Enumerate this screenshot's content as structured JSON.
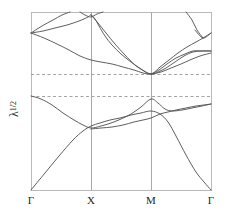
{
  "figure": {
    "background_color": "#ffffff",
    "frame_color": "#b9b9b9",
    "curve_color": "#555555",
    "gridline_color": "#a8a8a8",
    "dashed_line_color": "#9a9a9a"
  },
  "axes": {
    "y_label_base": "λ",
    "y_label_exponent": "1/2",
    "x_ticks": [
      {
        "label": "Γ",
        "x_px": 31
      },
      {
        "label": "X",
        "x_px": 91
      },
      {
        "label": "M",
        "x_px": 151
      },
      {
        "label": "Γ",
        "x_px": 211
      }
    ],
    "frame": {
      "left": 31,
      "right": 211,
      "top": 12,
      "bottom": 190
    },
    "vertical_gridlines_px": [
      91,
      151
    ],
    "horizontal_dashed_lines_px": [
      74,
      96
    ]
  },
  "chart_data": {
    "type": "line",
    "title": "",
    "xlabel": "",
    "ylabel": "λ^1/2",
    "x": [
      0,
      1,
      2,
      3
    ],
    "categories": [
      "Γ",
      "X",
      "M",
      "Γ"
    ],
    "xlim": [
      0,
      3
    ],
    "ylim": [
      0,
      1
    ],
    "grid": true,
    "legend": "none",
    "annotations": [
      {
        "type": "hline",
        "label": "upper dashed reference",
        "y_px": 74
      },
      {
        "type": "hline",
        "label": "lower dashed reference",
        "y_px": 96
      }
    ],
    "series": [
      {
        "name": "acoustic-band-1",
        "points_px": [
          [
            31,
            190
          ],
          [
            45,
            173
          ],
          [
            59,
            156
          ],
          [
            73,
            140
          ],
          [
            83,
            131
          ],
          [
            91,
            126
          ],
          [
            100,
            123
          ],
          [
            110,
            120
          ],
          [
            120,
            118
          ],
          [
            131,
            115
          ],
          [
            141,
            113
          ],
          [
            151,
            111
          ],
          [
            160,
            114
          ],
          [
            168,
            122
          ],
          [
            176,
            136
          ],
          [
            186,
            155
          ],
          [
            196,
            172
          ],
          [
            204,
            182
          ],
          [
            211,
            190
          ]
        ]
      },
      {
        "name": "acoustic-band-2",
        "points_px": [
          [
            31,
            96
          ],
          [
            41,
            99
          ],
          [
            52,
            105
          ],
          [
            63,
            113
          ],
          [
            74,
            120
          ],
          [
            83,
            125
          ],
          [
            91,
            128
          ],
          [
            101,
            126
          ],
          [
            111,
            123
          ],
          [
            121,
            119
          ],
          [
            131,
            114
          ],
          [
            141,
            107
          ],
          [
            151,
            99
          ],
          [
            158,
            103
          ],
          [
            165,
            109
          ],
          [
            172,
            111
          ],
          [
            182,
            110
          ],
          [
            192,
            108
          ],
          [
            202,
            106
          ],
          [
            211,
            104
          ]
        ]
      },
      {
        "name": "acoustic-band-3",
        "points_px": [
          [
            91,
            129
          ],
          [
            101,
            128
          ],
          [
            112,
            127
          ],
          [
            123,
            125
          ],
          [
            134,
            122
          ],
          [
            143,
            120
          ],
          [
            151,
            118
          ],
          [
            160,
            114
          ],
          [
            168,
            112
          ],
          [
            176,
            110
          ],
          [
            186,
            108
          ],
          [
            196,
            106
          ],
          [
            204,
            105
          ],
          [
            211,
            104
          ]
        ]
      },
      {
        "name": "optical-band-1",
        "points_px": [
          [
            31,
            33
          ],
          [
            44,
            38
          ],
          [
            57,
            44
          ],
          [
            69,
            50
          ],
          [
            80,
            56
          ],
          [
            91,
            60
          ],
          [
            101,
            62
          ],
          [
            112,
            64
          ],
          [
            123,
            67
          ],
          [
            134,
            70
          ],
          [
            143,
            73
          ],
          [
            151,
            74
          ],
          [
            161,
            72
          ],
          [
            171,
            68
          ],
          [
            181,
            64
          ],
          [
            190,
            60
          ],
          [
            200,
            56
          ],
          [
            211,
            53
          ]
        ]
      },
      {
        "name": "optical-band-2",
        "points_px": [
          [
            31,
            33
          ],
          [
            43,
            31
          ],
          [
            55,
            28
          ],
          [
            67,
            25
          ],
          [
            79,
            21
          ],
          [
            88,
            17
          ],
          [
            91,
            15
          ],
          [
            95,
            19
          ],
          [
            99,
            26
          ],
          [
            105,
            36
          ],
          [
            112,
            45
          ],
          [
            121,
            54
          ],
          [
            131,
            62
          ],
          [
            141,
            69
          ],
          [
            151,
            74
          ],
          [
            160,
            67
          ],
          [
            169,
            60
          ],
          [
            178,
            53
          ],
          [
            187,
            47
          ],
          [
            196,
            42
          ],
          [
            203,
            38
          ],
          [
            211,
            33
          ]
        ]
      },
      {
        "name": "optical-band-3",
        "points_px": [
          [
            31,
            33
          ],
          [
            42,
            26
          ],
          [
            53,
            20
          ],
          [
            62,
            15
          ],
          [
            70,
            12
          ]
        ]
      },
      {
        "name": "optical-band-4",
        "points_px": [
          [
            80,
            12
          ],
          [
            85,
            15
          ],
          [
            91,
            17
          ],
          [
            97,
            14
          ],
          [
            103,
            12
          ]
        ]
      },
      {
        "name": "optical-band-5",
        "points_px": [
          [
            91,
            15
          ],
          [
            98,
            23
          ],
          [
            106,
            33
          ],
          [
            115,
            44
          ],
          [
            125,
            55
          ],
          [
            135,
            65
          ],
          [
            144,
            71
          ],
          [
            151,
            74
          ],
          [
            158,
            72
          ],
          [
            166,
            68
          ],
          [
            175,
            62
          ],
          [
            184,
            56
          ],
          [
            193,
            52
          ],
          [
            201,
            51
          ],
          [
            211,
            51
          ]
        ]
      },
      {
        "name": "optical-band-6",
        "points_px": [
          [
            151,
            74
          ],
          [
            159,
            70
          ],
          [
            167,
            64
          ],
          [
            176,
            58
          ],
          [
            185,
            54
          ],
          [
            193,
            51
          ],
          [
            201,
            51
          ],
          [
            211,
            51
          ]
        ]
      },
      {
        "name": "optical-band-7",
        "points_px": [
          [
            195,
            30
          ],
          [
            203,
            38
          ],
          [
            211,
            33
          ]
        ]
      },
      {
        "name": "optical-band-8",
        "points_px": [
          [
            186,
            12
          ],
          [
            192,
            20
          ],
          [
            197,
            30
          ],
          [
            203,
            38
          ]
        ]
      }
    ]
  }
}
